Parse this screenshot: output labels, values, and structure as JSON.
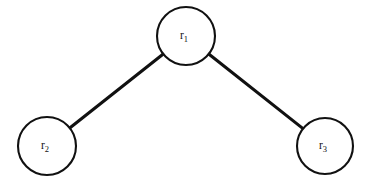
{
  "diagram": {
    "type": "graph",
    "title": "",
    "background_color": "#ffffff",
    "stroke_color": "#111111",
    "node_fill_color": "#ffffff",
    "node_stroke_width": 2,
    "edge_stroke_width": 3,
    "nodes": [
      {
        "id": "r1",
        "label_base": "r",
        "label_subscript": "1",
        "label_full": "r1",
        "cx": 186,
        "cy": 36,
        "r": 29
      },
      {
        "id": "r2",
        "label_base": "r",
        "label_subscript": "2",
        "label_full": "r2",
        "cx": 47,
        "cy": 146,
        "r": 29
      },
      {
        "id": "r3",
        "label_base": "r",
        "label_subscript": "3",
        "label_full": "r3",
        "cx": 325,
        "cy": 146,
        "r": 28
      }
    ],
    "edges": [
      {
        "id": "edge-r1-r2",
        "from": "r1",
        "to": "r2",
        "x1": 163.6,
        "y1": 54.5,
        "x2": 69.4,
        "y2": 127.5
      },
      {
        "id": "edge-r1-r3",
        "from": "r1",
        "to": "r3",
        "x1": 209.2,
        "y1": 55.5,
        "x2": 303.6,
        "y2": 127.0
      }
    ]
  }
}
